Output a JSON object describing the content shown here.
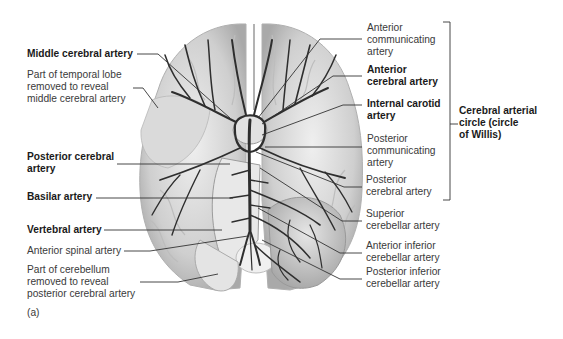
{
  "figure": {
    "panel_label": "(a)"
  },
  "labels_left": [
    {
      "id": "middle-cerebral-artery",
      "lines": [
        "Middle cerebral artery"
      ],
      "bold": true
    },
    {
      "id": "temporal-lobe-removed",
      "lines": [
        "Part of temporal lobe",
        "removed to reveal",
        "middle cerebral artery"
      ],
      "bold": false
    },
    {
      "id": "posterior-cerebral-artery-left",
      "lines": [
        "Posterior cerebral",
        "artery"
      ],
      "bold": true
    },
    {
      "id": "basilar-artery",
      "lines": [
        "Basilar artery"
      ],
      "bold": true
    },
    {
      "id": "vertebral-artery",
      "lines": [
        "Vertebral artery"
      ],
      "bold": true
    },
    {
      "id": "anterior-spinal-artery",
      "lines": [
        "Anterior spinal artery"
      ],
      "bold": false
    },
    {
      "id": "cerebellum-removed",
      "lines": [
        "Part of cerebellum",
        "removed to reveal",
        "posterior cerebral artery"
      ],
      "bold": false
    }
  ],
  "labels_right": [
    {
      "id": "anterior-communicating-artery",
      "lines": [
        "Anterior",
        "communicating",
        "artery"
      ],
      "bold": false
    },
    {
      "id": "anterior-cerebral-artery",
      "lines": [
        "Anterior",
        "cerebral artery"
      ],
      "bold": true
    },
    {
      "id": "internal-carotid-artery",
      "lines": [
        "Internal carotid",
        "artery"
      ],
      "bold": true
    },
    {
      "id": "posterior-communicating-artery",
      "lines": [
        "Posterior",
        "communicating",
        "artery"
      ],
      "bold": false
    },
    {
      "id": "posterior-cerebral-artery-right",
      "lines": [
        "Posterior",
        "cerebral artery"
      ],
      "bold": false
    },
    {
      "id": "superior-cerebellar-artery",
      "lines": [
        "Superior",
        "cerebellar artery"
      ],
      "bold": false
    },
    {
      "id": "anterior-inferior-cerebellar-artery",
      "lines": [
        "Anterior inferior",
        "cerebellar artery"
      ],
      "bold": false
    },
    {
      "id": "posterior-inferior-cerebellar-artery",
      "lines": [
        "Posterior inferior",
        "cerebellar artery"
      ],
      "bold": false
    }
  ],
  "bracket_label": {
    "id": "cerebral-arterial-circle",
    "lines": [
      "Cerebral arterial",
      "circle (circle",
      "of Willis)"
    ],
    "bold": true
  },
  "colors": {
    "brain_fill": "#d4d4d4",
    "brain_light": "#ececec",
    "vessel": "#2e2e2e",
    "leader": "#333333",
    "text": "#3a3a3a"
  }
}
